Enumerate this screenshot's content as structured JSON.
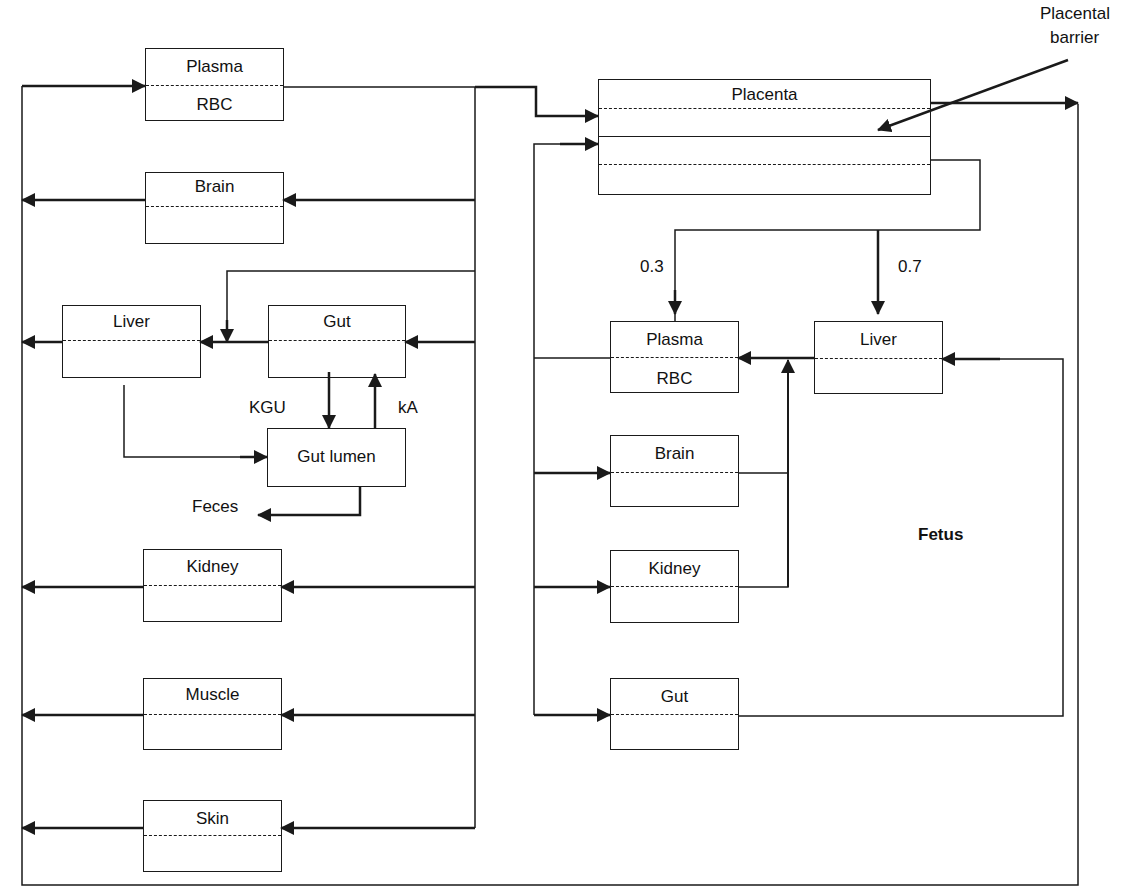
{
  "diagram": {
    "type": "PBPK pregnancy model schematic",
    "maternal": {
      "plasma": {
        "top": "Plasma",
        "bottom": "RBC"
      },
      "brain": "Brain",
      "liver": "Liver",
      "gut": "Gut",
      "gut_lumen": "Gut lumen",
      "kidney": "Kidney",
      "muscle": "Muscle",
      "skin": "Skin",
      "rate_kgu": "KGU",
      "rate_ka": "kA",
      "feces": "Feces"
    },
    "placenta": {
      "label": "Placenta",
      "barrier_label_line1": "Placental",
      "barrier_label_line2": "barrier"
    },
    "fetal": {
      "title": "Fetus",
      "split_plasma": "0.3",
      "split_liver": "0.7",
      "plasma": {
        "top": "Plasma",
        "bottom": "RBC"
      },
      "liver": "Liver",
      "brain": "Brain",
      "kidney": "Kidney",
      "gut": "Gut"
    },
    "colors": {
      "line": "#1a1a1a",
      "background": "#ffffff"
    }
  }
}
